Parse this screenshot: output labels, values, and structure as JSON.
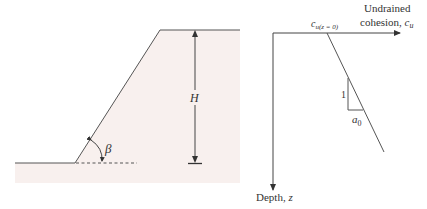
{
  "figure": {
    "left_panel": {
      "description": "slope geometry",
      "labels": {
        "height": "H",
        "angle": "β"
      }
    },
    "right_panel": {
      "description": "undrained cohesion vs depth",
      "labels": {
        "x_axis_line1": "Undrained",
        "x_axis_line2": "cohesion, ",
        "x_axis_symbol": "c",
        "x_axis_subscript": "u",
        "y_axis": "Depth, ",
        "y_axis_symbol": "z",
        "intercept_symbol": "c",
        "intercept_subscript": "u(z = 0)",
        "slope_vertical": "1",
        "slope_horizontal_symbol": "a",
        "slope_horizontal_subscript": "0"
      }
    },
    "colors": {
      "soil_fill": "#f8f0ee",
      "line": "#444444",
      "text": "#333333"
    }
  }
}
